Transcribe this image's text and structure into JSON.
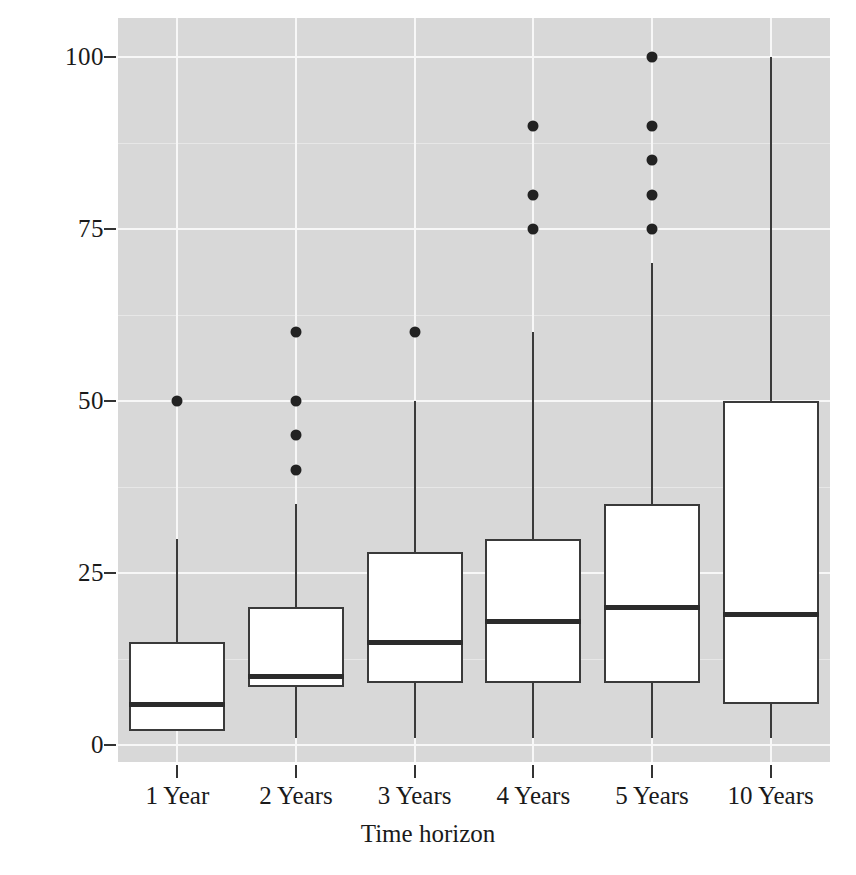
{
  "chart_data": {
    "type": "box",
    "title": "",
    "xlabel": "Time horizon",
    "ylabel": "Days to prefer long-term option",
    "categories": [
      "1 Year",
      "2 Years",
      "3 Years",
      "4 Years",
      "5 Years",
      "10 Years"
    ],
    "ylim": [
      -3,
      105
    ],
    "yticks": [
      0,
      25,
      50,
      75,
      100
    ],
    "ytick_labels": [
      "0",
      "25",
      "50",
      "75",
      "100"
    ],
    "grid": true,
    "legend": "none",
    "panel_background": "#d8d8d8",
    "gridline_color": "#f7f7f7",
    "box_fill": "#ffffff",
    "box_stroke": "#3a3a3a",
    "outlier_color": "#222222",
    "boxes": [
      {
        "category": "1 Year",
        "whisker_low": 2,
        "q1": 2,
        "median": 6,
        "q3": 15,
        "whisker_high": 30,
        "outliers": [
          50
        ]
      },
      {
        "category": "2 Years",
        "whisker_low": 1,
        "q1": 8.5,
        "median": 10,
        "q3": 20,
        "whisker_high": 35,
        "outliers": [
          40,
          45,
          50,
          60
        ]
      },
      {
        "category": "3 Years",
        "whisker_low": 1,
        "q1": 9,
        "median": 15,
        "q3": 28,
        "whisker_high": 50,
        "outliers": [
          60
        ]
      },
      {
        "category": "4 Years",
        "whisker_low": 1,
        "q1": 9,
        "median": 18,
        "q3": 30,
        "whisker_high": 60,
        "outliers": [
          75,
          80,
          90
        ]
      },
      {
        "category": "5 Years",
        "whisker_low": 1,
        "q1": 9,
        "median": 20,
        "q3": 35,
        "whisker_high": 70,
        "outliers": [
          75,
          80,
          85,
          90,
          100
        ]
      },
      {
        "category": "10 Years",
        "whisker_low": 1,
        "q1": 6,
        "median": 19,
        "q3": 50,
        "whisker_high": 100,
        "outliers": []
      }
    ]
  }
}
